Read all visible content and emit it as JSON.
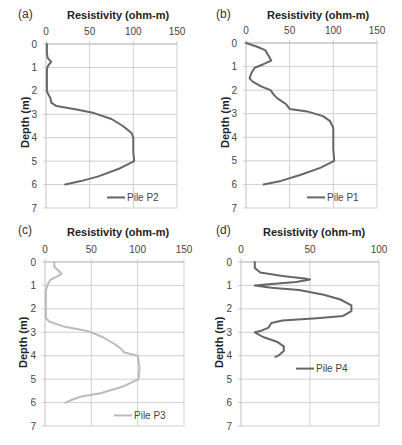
{
  "chart_data": [
    {
      "type": "line",
      "panel_label": "(a)",
      "title": "Resistivity (ohm-m)",
      "xlabel": "Resistivity (ohm-m)",
      "ylabel": "Depth (m)",
      "xlim": [
        0,
        150
      ],
      "ylim": [
        0,
        7
      ],
      "y_inverted": true,
      "x_axis_position": "top",
      "xticks": [
        0,
        50,
        100,
        150
      ],
      "yticks": [
        0,
        1,
        2,
        3,
        4,
        5,
        6,
        7
      ],
      "grid": true,
      "legend_position": "bottom-right",
      "color": "#666666",
      "series": [
        {
          "name": "Pile P2",
          "points": [
            [
              1,
              0
            ],
            [
              1,
              0.4
            ],
            [
              2,
              0.6
            ],
            [
              6,
              0.75
            ],
            [
              2,
              0.95
            ],
            [
              1,
              1.1
            ],
            [
              1,
              2.0
            ],
            [
              2,
              2.1
            ],
            [
              5,
              2.3
            ],
            [
              6,
              2.5
            ],
            [
              12,
              2.65
            ],
            [
              35,
              2.8
            ],
            [
              55,
              2.95
            ],
            [
              75,
              3.2
            ],
            [
              88,
              3.5
            ],
            [
              98,
              3.8
            ],
            [
              100,
              4.0
            ],
            [
              100,
              4.6
            ],
            [
              101,
              5.0
            ],
            [
              85,
              5.3
            ],
            [
              60,
              5.65
            ],
            [
              40,
              5.85
            ],
            [
              22,
              6.0
            ]
          ]
        }
      ]
    },
    {
      "type": "line",
      "panel_label": "(b)",
      "title": "Resistivity (ohm-m)",
      "xlabel": "Resistivity (ohm-m)",
      "ylabel": "Depth (m)",
      "xlim": [
        0,
        150
      ],
      "ylim": [
        0,
        7
      ],
      "y_inverted": true,
      "x_axis_position": "top",
      "xticks": [
        0,
        50,
        100,
        150
      ],
      "yticks": [
        0,
        1,
        2,
        3,
        4,
        5,
        6,
        7
      ],
      "grid": true,
      "legend_position": "bottom-right",
      "color": "#666666",
      "series": [
        {
          "name": "Pile P1",
          "points": [
            [
              0,
              0
            ],
            [
              12,
              0.15
            ],
            [
              22,
              0.3
            ],
            [
              26,
              0.55
            ],
            [
              29,
              0.75
            ],
            [
              20,
              0.9
            ],
            [
              10,
              1.05
            ],
            [
              6,
              1.3
            ],
            [
              4,
              1.5
            ],
            [
              8,
              1.65
            ],
            [
              18,
              1.85
            ],
            [
              28,
              2.0
            ],
            [
              32,
              2.2
            ],
            [
              36,
              2.35
            ],
            [
              42,
              2.5
            ],
            [
              46,
              2.6
            ],
            [
              50,
              2.8
            ],
            [
              70,
              2.9
            ],
            [
              88,
              3.1
            ],
            [
              96,
              3.3
            ],
            [
              100,
              3.6
            ],
            [
              100,
              4.5
            ],
            [
              101,
              5.0
            ],
            [
              85,
              5.3
            ],
            [
              62,
              5.6
            ],
            [
              40,
              5.85
            ],
            [
              20,
              6.0
            ]
          ]
        }
      ]
    },
    {
      "type": "line",
      "panel_label": "(c)",
      "title": "Resistivity (ohm-m)",
      "xlabel": "Resistivity (ohm-m)",
      "ylabel": "Depth (m)",
      "xlim": [
        0,
        150
      ],
      "ylim": [
        0,
        7
      ],
      "y_inverted": true,
      "x_axis_position": "top",
      "xticks": [
        0,
        50,
        100,
        150
      ],
      "yticks": [
        0,
        1,
        2,
        3,
        4,
        5,
        6,
        7
      ],
      "grid": true,
      "legend_position": "bottom-right",
      "color": "#bbbbbb",
      "series": [
        {
          "name": "Pile P3",
          "points": [
            [
              10,
              0
            ],
            [
              10,
              0.2
            ],
            [
              14,
              0.35
            ],
            [
              18,
              0.5
            ],
            [
              14,
              0.6
            ],
            [
              6,
              0.75
            ],
            [
              3,
              0.95
            ],
            [
              1,
              1.2
            ],
            [
              1,
              2.0
            ],
            [
              1,
              2.4
            ],
            [
              5,
              2.55
            ],
            [
              20,
              2.75
            ],
            [
              40,
              2.9
            ],
            [
              50,
              3.0
            ],
            [
              62,
              3.2
            ],
            [
              75,
              3.5
            ],
            [
              82,
              3.7
            ],
            [
              85,
              3.85
            ],
            [
              100,
              4.0
            ],
            [
              102,
              4.5
            ],
            [
              101,
              5.0
            ],
            [
              85,
              5.3
            ],
            [
              60,
              5.6
            ],
            [
              38,
              5.75
            ],
            [
              28,
              5.9
            ],
            [
              22,
              6.0
            ]
          ]
        }
      ]
    },
    {
      "type": "line",
      "panel_label": "(d)",
      "title": "Resistivity (ohm-m)",
      "xlabel": "Resistivity (ohm-m)",
      "ylabel": "Depth (m)",
      "xlim": [
        0,
        100
      ],
      "ylim": [
        0,
        7
      ],
      "y_inverted": true,
      "x_axis_position": "top",
      "xticks": [
        0,
        50,
        100
      ],
      "yticks": [
        0,
        1,
        2,
        3,
        4,
        5,
        6,
        7
      ],
      "grid": true,
      "legend_position": "middle-right",
      "color": "#666666",
      "series": [
        {
          "name": "Pile P4",
          "points": [
            [
              10,
              0
            ],
            [
              10,
              0.25
            ],
            [
              14,
              0.45
            ],
            [
              30,
              0.6
            ],
            [
              46,
              0.7
            ],
            [
              50,
              0.75
            ],
            [
              40,
              0.85
            ],
            [
              20,
              0.95
            ],
            [
              10,
              1.0
            ],
            [
              22,
              1.1
            ],
            [
              42,
              1.2
            ],
            [
              60,
              1.4
            ],
            [
              72,
              1.6
            ],
            [
              80,
              1.85
            ],
            [
              80,
              2.1
            ],
            [
              74,
              2.3
            ],
            [
              55,
              2.4
            ],
            [
              30,
              2.5
            ],
            [
              22,
              2.6
            ],
            [
              20,
              2.8
            ],
            [
              14,
              2.95
            ],
            [
              10,
              3.0
            ],
            [
              16,
              3.2
            ],
            [
              26,
              3.4
            ],
            [
              31,
              3.6
            ],
            [
              31,
              3.8
            ],
            [
              27,
              4.0
            ],
            [
              25,
              4.05
            ]
          ]
        }
      ]
    }
  ],
  "panels": [
    {
      "label": "(a)",
      "title": "Resistivity (ohm-m)",
      "ylabel": "Depth (m)",
      "legend": "Pile P2"
    },
    {
      "label": "(b)",
      "title": "Resistivity (ohm-m)",
      "ylabel": "Depth (m)",
      "legend": "Pile P1"
    },
    {
      "label": "(c)",
      "title": "Resistivity (ohm-m)",
      "ylabel": "Depth (m)",
      "legend": "Pile P3"
    },
    {
      "label": "(d)",
      "title": "Resistivity (ohm-m)",
      "ylabel": "Depth (m)",
      "legend": "Pile P4"
    }
  ],
  "style": {
    "grid_color": "#cfcfcf",
    "axis_color": "#bfbfbf",
    "line_dark": "#666666",
    "line_light": "#bbbbbb"
  }
}
